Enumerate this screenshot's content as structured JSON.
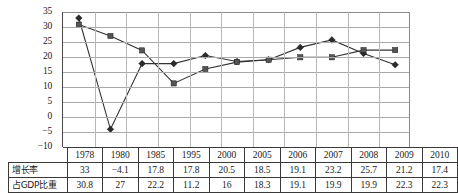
{
  "chart_data": {
    "type": "line",
    "title": "",
    "xlabel": "",
    "ylabel": "",
    "ylim": [
      -10,
      35
    ],
    "yticks": [
      35,
      30,
      25,
      20,
      15,
      10,
      5,
      0,
      -5,
      -10
    ],
    "ytick_labels": [
      "35",
      "30",
      "25",
      "20",
      "15",
      "10",
      "5",
      "0",
      "−5",
      "−10"
    ],
    "grid": true,
    "legend": "none",
    "categories": [
      "1978",
      "1980",
      "1985",
      "1995",
      "2000",
      "2005",
      "2006",
      "2007",
      "2008",
      "2009",
      "2010"
    ],
    "series": [
      {
        "name": "增长率",
        "marker": "diamond",
        "color": "#2b2b2b",
        "values": [
          33,
          -4.1,
          17.8,
          17.8,
          20.5,
          18.5,
          19.1,
          23.2,
          25.7,
          21.2,
          17.4
        ],
        "value_labels": [
          "33",
          "−4.1",
          "17.8",
          "17.8",
          "20.5",
          "18.5",
          "19.1",
          "23.2",
          "25.7",
          "21.2",
          "17.4"
        ]
      },
      {
        "name": "占GDP比重",
        "marker": "square",
        "color": "#555555",
        "values": [
          30.8,
          27,
          22.2,
          11.2,
          16,
          18.3,
          19.1,
          19.9,
          19.9,
          22.3,
          22.3
        ],
        "value_labels": [
          "30.8",
          "27",
          "22.2",
          "11.2",
          "16",
          "18.3",
          "19.1",
          "19.9",
          "19.9",
          "22.3",
          "22.3"
        ]
      }
    ]
  },
  "table": {
    "corner_label": "",
    "header": [
      "1978",
      "1980",
      "1985",
      "1995",
      "2000",
      "2005",
      "2006",
      "2007",
      "2008",
      "2009",
      "2010"
    ],
    "rows": [
      {
        "label": "增长率",
        "cells": [
          "33",
          "−4.1",
          "17.8",
          "17.8",
          "20.5",
          "18.5",
          "19.1",
          "23.2",
          "25.7",
          "21.2",
          "17.4"
        ]
      },
      {
        "label": "占GDP比重",
        "cells": [
          "30.8",
          "27",
          "22.2",
          "11.2",
          "16",
          "18.3",
          "19.1",
          "19.9",
          "19.9",
          "22.3",
          "22.3"
        ]
      }
    ]
  }
}
